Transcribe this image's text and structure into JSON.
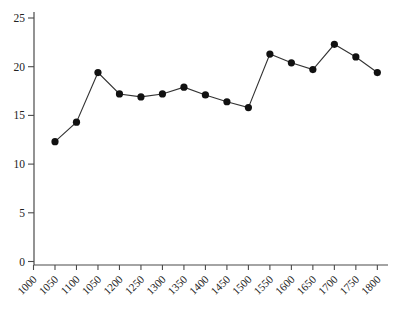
{
  "page": {
    "background_color": "#ffffff"
  },
  "chart_data": {
    "type": "line",
    "title": "",
    "xlabel": "",
    "ylabel": "",
    "x": [
      1050,
      1100,
      1150,
      1200,
      1250,
      1300,
      1350,
      1400,
      1450,
      1500,
      1550,
      1600,
      1650,
      1700,
      1750,
      1800
    ],
    "values": [
      12.3,
      14.3,
      19.4,
      17.2,
      16.9,
      17.2,
      17.9,
      17.1,
      16.4,
      15.8,
      21.3,
      20.4,
      19.7,
      22.3,
      21.0,
      19.4
    ],
    "series_name": "",
    "x_tick_values": [
      1000,
      1050,
      1100,
      1150,
      1200,
      1250,
      1300,
      1350,
      1400,
      1450,
      1500,
      1550,
      1600,
      1650,
      1700,
      1750,
      1800
    ],
    "x_tick_labels": [
      "1000",
      "1050",
      "1100",
      "1050",
      "1200",
      "1250",
      "1300",
      "1350",
      "1400",
      "1450",
      "1500",
      "1550",
      "1600",
      "1650",
      "1700",
      "1750",
      "1800"
    ],
    "y_tick_values": [
      0,
      5,
      10,
      15,
      20,
      25
    ],
    "y_tick_labels": [
      "0",
      "5",
      "10",
      "15",
      "20",
      "25"
    ],
    "ylim": [
      0,
      25
    ],
    "xlim": [
      1000,
      1825
    ],
    "x_tick_rotation_deg": 45,
    "grid": false,
    "legend": "none",
    "marker": "filled-circle",
    "line_color": "#333333",
    "marker_color": "#111111",
    "axis_color": "#4a4a4a",
    "tick_label_color": "#222222"
  }
}
